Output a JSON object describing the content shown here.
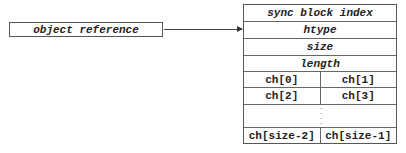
{
  "reference": {
    "label": "object reference"
  },
  "object_layout": {
    "header_rows": [
      {
        "label": "sync block index"
      },
      {
        "label": "htype"
      },
      {
        "label": "size"
      },
      {
        "label": "length"
      }
    ],
    "char_rows": [
      {
        "left": "ch[0]",
        "right": "ch[1]"
      },
      {
        "left": "ch[2]",
        "right": "ch[3]"
      }
    ],
    "ellipsis": {
      "dots": [
        "·",
        "·",
        "·",
        "·"
      ]
    },
    "last_row": {
      "left": "ch[size-2]",
      "right": "ch[size-1]"
    }
  },
  "colors": {
    "border": "#555555",
    "text": "#222222",
    "arrow": "#444444"
  }
}
